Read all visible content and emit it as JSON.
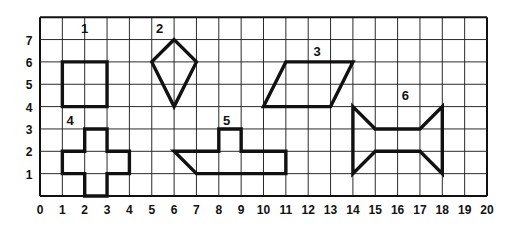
{
  "figure": {
    "background_color": "#ffffff",
    "ink_color": "#111111",
    "grid_line_color": "#2b2b2b",
    "grid": {
      "x_min": 0,
      "x_max": 20,
      "y_min": 0,
      "y_max": 8,
      "cell_size_px": 22.35,
      "origin_px": {
        "x": 40,
        "y": 196
      },
      "show_grid": true
    },
    "x_axis": {
      "label": "",
      "ticks": [
        "0",
        "1",
        "2",
        "3",
        "4",
        "5",
        "6",
        "7",
        "8",
        "9",
        "10",
        "11",
        "12",
        "13",
        "14",
        "15",
        "16",
        "17",
        "18",
        "19",
        "20"
      ],
      "tick_values": [
        0,
        1,
        2,
        3,
        4,
        5,
        6,
        7,
        8,
        9,
        10,
        11,
        12,
        13,
        14,
        15,
        16,
        17,
        18,
        19,
        20
      ]
    },
    "y_axis": {
      "label": "",
      "ticks": [
        "1",
        "2",
        "3",
        "4",
        "5",
        "6",
        "7"
      ],
      "tick_values": [
        1,
        2,
        3,
        4,
        5,
        6,
        7
      ]
    },
    "shapes": [
      {
        "id": "shape-1",
        "label": "1",
        "kind": "square",
        "label_position": {
          "x": 2,
          "y": 7.5
        },
        "closed": true,
        "points": [
          [
            1,
            4
          ],
          [
            1,
            6
          ],
          [
            3,
            6
          ],
          [
            3,
            4
          ]
        ]
      },
      {
        "id": "shape-2",
        "label": "2",
        "kind": "kite",
        "label_position": {
          "x": 5.35,
          "y": 7.5
        },
        "closed": true,
        "points": [
          [
            6,
            7
          ],
          [
            5,
            6
          ],
          [
            6,
            4
          ],
          [
            7,
            6
          ]
        ]
      },
      {
        "id": "shape-3",
        "label": "3",
        "kind": "parallelogram",
        "label_position": {
          "x": 12.4,
          "y": 6.5
        },
        "closed": true,
        "points": [
          [
            10,
            4
          ],
          [
            11,
            6
          ],
          [
            14,
            6
          ],
          [
            13,
            4
          ]
        ]
      },
      {
        "id": "shape-4",
        "label": "4",
        "kind": "cross",
        "label_position": {
          "x": 1.35,
          "y": 3.4
        },
        "closed": true,
        "points": [
          [
            2,
            0
          ],
          [
            2,
            1
          ],
          [
            1,
            1
          ],
          [
            1,
            2
          ],
          [
            2,
            2
          ],
          [
            2,
            3
          ],
          [
            3,
            3
          ],
          [
            3,
            2
          ],
          [
            4,
            2
          ],
          [
            4,
            1
          ],
          [
            3,
            1
          ],
          [
            3,
            0
          ]
        ]
      },
      {
        "id": "shape-5",
        "label": "5",
        "kind": "irregular-polygon",
        "label_position": {
          "x": 8.35,
          "y": 3.4
        },
        "closed": true,
        "points": [
          [
            6,
            2
          ],
          [
            8,
            2
          ],
          [
            8,
            3
          ],
          [
            9,
            3
          ],
          [
            9,
            2
          ],
          [
            11,
            2
          ],
          [
            11,
            1
          ],
          [
            7,
            1
          ]
        ]
      },
      {
        "id": "shape-6",
        "label": "6",
        "kind": "hourglass",
        "label_position": {
          "x": 16.35,
          "y": 4.5
        },
        "closed": true,
        "points": [
          [
            14,
            4
          ],
          [
            15,
            3
          ],
          [
            17,
            3
          ],
          [
            18,
            4
          ],
          [
            18,
            1
          ],
          [
            17,
            2
          ],
          [
            15,
            2
          ],
          [
            14,
            1
          ]
        ]
      }
    ]
  }
}
